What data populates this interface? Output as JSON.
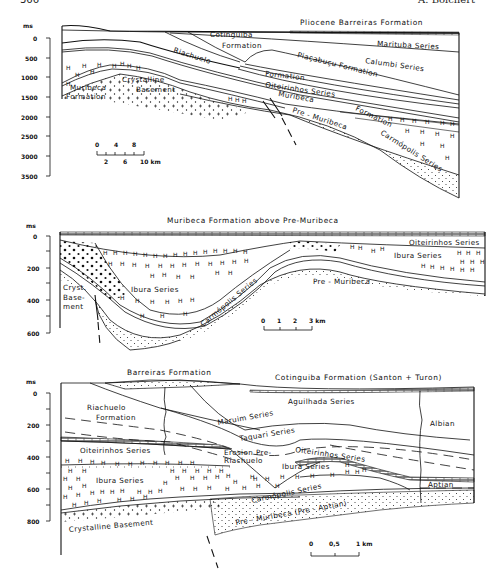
{
  "page": {
    "page_number": "366",
    "author": "A. Bolchert"
  },
  "section1": {
    "title": "Pliocene Barreiras Formation",
    "axis_unit": "ms",
    "axis_ticks": [
      "0",
      "500",
      "1000",
      "1500",
      "2000",
      "2500",
      "3000",
      "3500"
    ],
    "scale_bar": {
      "top_labels": [
        "0",
        "4",
        "8"
      ],
      "bottom_labels": [
        "2",
        "6",
        "10 km"
      ]
    },
    "labels": {
      "cotinguiba": "Cotinguiba",
      "cotinguiba2": "Formation",
      "marituba": "Marituba Series",
      "calumbi": "Calumbi Series",
      "piacabucu": "Piaçabuçu Formation",
      "riachuelo": "Riachuelo",
      "riachuelo2": "Formation",
      "oiteirinhos": "Oiteirinhos Series",
      "muribeca": "Muribeca",
      "muribeca_formation1": "Muribeca",
      "muribeca_formation2": "Formation",
      "crystalline1": "Crystalline",
      "crystalline2": "Basement",
      "pre_muribeca": "Pre - Muribeca",
      "formation": "Formation",
      "carmopolis": "Carmópolis Series"
    }
  },
  "section2": {
    "title": "Muribeca Formation above Pre-Muribeca",
    "axis_unit": "ms",
    "axis_ticks": [
      "0",
      "200",
      "400",
      "600"
    ],
    "scale_bar": {
      "labels": [
        "0",
        "1",
        "2",
        "3 km"
      ]
    },
    "labels": {
      "oiteirinhos": "Oiteirinhos Series",
      "ibura_left": "Ibura Series",
      "ibura_right": "Ibura Series",
      "carmopolis": "Carmópolis Series",
      "pre_muribeca": "Pre - Muribeca",
      "cryst1": "Cryst.",
      "cryst2": "Base-",
      "cryst3": "ment"
    }
  },
  "section3": {
    "title_left": "Barreiras Formation",
    "title_right": "Cotinguiba Formation (Santon + Turon)",
    "axis_unit": "ms",
    "axis_ticks": [
      "0",
      "200",
      "400",
      "600",
      "800"
    ],
    "scale_bar": {
      "labels": [
        "0",
        "0,5",
        "1 km"
      ]
    },
    "labels": {
      "riachuelo1": "Riachuelo",
      "riachuelo2": "Formation",
      "aguilhada": "Aguilhada Series",
      "maruim": "Maruim Series",
      "taquari": "Taquari Series",
      "albian": "Albian",
      "oiteirinhos_left": "Oiteirinhos Series",
      "oiteirinhos_right": "Oiteirinhos Series",
      "erosion1": "Erosion Pre-",
      "erosion2": "Riachuelo",
      "ibura_left": "Ibura Series",
      "ibura_right": "Ibura Series",
      "carmopolis": "Carmópolis Series",
      "aptian": "Aptian",
      "crystalline": "Crystalline Basement",
      "pre_muribeca": "Pre - Muribeca (Pre - Aptian)"
    }
  }
}
